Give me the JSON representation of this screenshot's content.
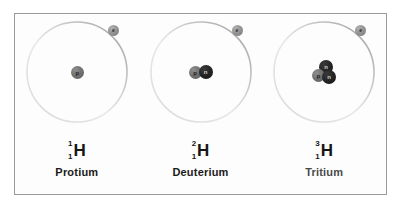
{
  "figure": {
    "panel_border_color": "#9a9a9a",
    "panel_background": "#fdfdfd",
    "proton_color": "#6e6e6e",
    "neutron_color": "#222222",
    "electron_color": "#8f8f8f",
    "orbit_color": "#b4b4b4"
  },
  "isotopes": [
    {
      "name": "Protium",
      "name_shade": "shade-dark",
      "mass_number": "1",
      "atomic_number": "1",
      "symbol": "H",
      "electron_label": "e",
      "nucleus": [
        {
          "type": "proton",
          "label": "p",
          "x": -6,
          "y": -6
        }
      ]
    },
    {
      "name": "Deuterium",
      "name_shade": "shade-dark",
      "mass_number": "2",
      "atomic_number": "1",
      "symbol": "H",
      "electron_label": "e",
      "nucleus": [
        {
          "type": "proton",
          "label": "p",
          "x": -12,
          "y": -6
        },
        {
          "type": "neutron",
          "label": "n",
          "x": -2,
          "y": -7
        }
      ]
    },
    {
      "name": "Tritium",
      "name_shade": "shade-mid",
      "mass_number": "3",
      "atomic_number": "1",
      "symbol": "H",
      "electron_label": "e",
      "nucleus": [
        {
          "type": "neutron",
          "label": "n",
          "x": -5,
          "y": -12
        },
        {
          "type": "proton",
          "label": "p",
          "x": -12,
          "y": -3
        },
        {
          "type": "neutron",
          "label": "n",
          "x": -2,
          "y": -2
        }
      ]
    }
  ]
}
